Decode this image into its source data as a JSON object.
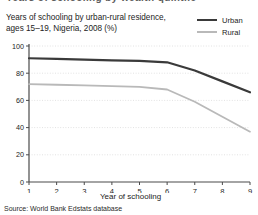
{
  "figure": {
    "clipped_header": "Years of schooling by wealth quintile",
    "title_line1": "Years of schooling by urban-rural residence,",
    "title_line2": "ages 15–19, Nigeria, 2008 (%)",
    "source": "Source: World Bank Edstats database",
    "colors": {
      "urban": "#3a3a3a",
      "rural": "#b9b9b9",
      "axis": "#4a4a4a",
      "grid": "#e2e2e2",
      "text": "#232323",
      "background": "#ffffff"
    }
  },
  "legend": {
    "position": "top-right",
    "entries": [
      {
        "label": "Urban",
        "color": "#3a3a3a",
        "swatch": "line-swatch-urban"
      },
      {
        "label": "Rural",
        "color": "#b9b9b9",
        "swatch": "line-swatch-rural"
      }
    ]
  },
  "chart_data": {
    "type": "line",
    "title": "Years of schooling by urban-rural residence, ages 15–19, Nigeria, 2008 (%)",
    "xlabel": "Year of schooling",
    "ylabel": "",
    "x": [
      1,
      2,
      3,
      4,
      5,
      6,
      7,
      8,
      9
    ],
    "xticklabels": [
      "1",
      "2",
      "3",
      "4",
      "5",
      "6",
      "7",
      "8",
      "9"
    ],
    "yticklabels": [
      "0",
      "20",
      "40",
      "60",
      "80",
      "100"
    ],
    "yticks": [
      0,
      20,
      40,
      60,
      80,
      100
    ],
    "xlim": [
      1,
      9
    ],
    "ylim": [
      0,
      100
    ],
    "grid": true,
    "grid_axis": "y",
    "legend_position": "top-right",
    "series": [
      {
        "name": "Urban",
        "color": "#3a3a3a",
        "values": [
          91,
          90.5,
          90,
          89.5,
          89,
          88,
          82,
          74,
          66
        ]
      },
      {
        "name": "Rural",
        "color": "#b9b9b9",
        "values": [
          72,
          71.5,
          71,
          70.5,
          70,
          68,
          59,
          48,
          37
        ]
      }
    ]
  }
}
